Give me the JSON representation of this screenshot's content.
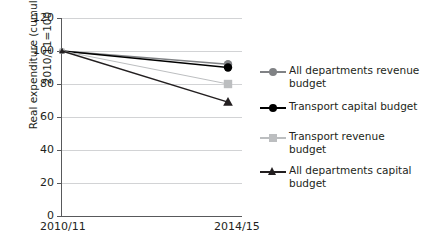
{
  "chart_data": {
    "type": "line",
    "title": "",
    "xlabel": "",
    "ylabel_line1": "Real expenditure (cumulative),",
    "ylabel_line2": "2010/11=100",
    "categories": [
      "2010/11",
      "2014/15"
    ],
    "x_tick_labels": [
      "2010/11",
      "2014/15"
    ],
    "y_tick_labels": [
      "0",
      "20",
      "40",
      "60",
      "80",
      "100",
      "120"
    ],
    "y_ticks": [
      0,
      20,
      40,
      60,
      80,
      100,
      120
    ],
    "ylim": [
      0,
      120
    ],
    "grid": "horizontal",
    "legend_position": "right",
    "series": [
      {
        "name": "All departments revenue budget",
        "values": [
          100,
          92
        ],
        "color": "#808285",
        "marker": "circle"
      },
      {
        "name": "Transport capital budget",
        "values": [
          100,
          90
        ],
        "color": "#000000",
        "marker": "circle"
      },
      {
        "name": "Transport revenue budget",
        "values": [
          100,
          80
        ],
        "color": "#bcbec0",
        "marker": "square"
      },
      {
        "name": "All departments capital budget",
        "values": [
          100,
          69
        ],
        "color": "#231f20",
        "marker": "triangle"
      }
    ]
  },
  "legend": {
    "items": [
      {
        "label": "All departments revenue budget"
      },
      {
        "label": "Transport capital budget"
      },
      {
        "label": "Transport revenue budget"
      },
      {
        "label": "All departments capital budget"
      }
    ]
  }
}
